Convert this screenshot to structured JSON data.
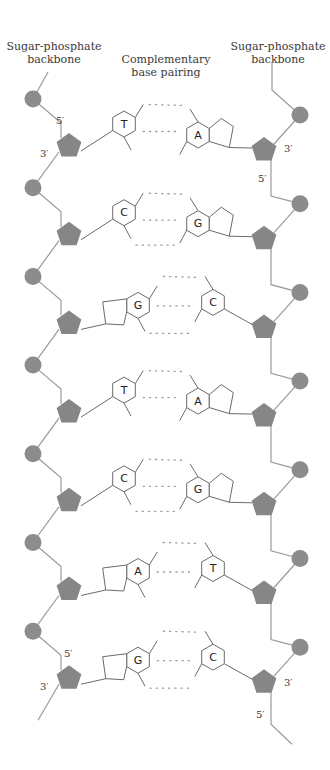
{
  "labels": {
    "left_backbone": [
      "Sugar-phosphate",
      "backbone"
    ],
    "base_pairing": [
      "Complementary",
      "base pairing"
    ],
    "right_backbone": [
      "Sugar-phosphate",
      "backbone"
    ]
  },
  "colors": {
    "phosphate": "#8c8c8c",
    "sugar": "#868686",
    "backbone_line": "#9a9a9a",
    "ring_stroke": "#6a6a6a"
  },
  "strand_end_labels": {
    "left_top_5": "5′",
    "left_top_3": "3′",
    "right_top_3": "3′",
    "right_top_5": "5′",
    "left_bottom_5": "5′",
    "left_bottom_3": "3′",
    "right_bottom_3": "3′",
    "right_bottom_5": "5′"
  },
  "base_pairs": [
    {
      "left": "T",
      "right": "A",
      "hydrogen_bonds": 2
    },
    {
      "left": "C",
      "right": "G",
      "hydrogen_bonds": 3
    },
    {
      "left": "G",
      "right": "C",
      "hydrogen_bonds": 3
    },
    {
      "left": "T",
      "right": "A",
      "hydrogen_bonds": 2
    },
    {
      "left": "C",
      "right": "G",
      "hydrogen_bonds": 3
    },
    {
      "left": "A",
      "right": "T",
      "hydrogen_bonds": 2
    },
    {
      "left": "G",
      "right": "C",
      "hydrogen_bonds": 3
    }
  ]
}
